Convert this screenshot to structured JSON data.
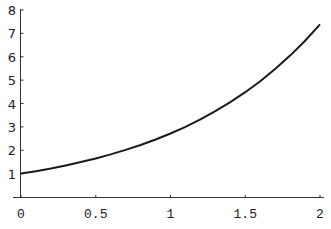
{
  "chart_data": {
    "type": "line",
    "title": "",
    "xlabel": "",
    "ylabel": "",
    "xlim": [
      0,
      2
    ],
    "ylim": [
      0,
      8
    ],
    "grid": false,
    "legend": null,
    "x_ticks": [
      0,
      0.5,
      1,
      1.5,
      2
    ],
    "x_tick_labels": [
      "0",
      "0.5",
      "1",
      "1.5",
      "2"
    ],
    "y_ticks": [
      1,
      2,
      3,
      4,
      5,
      6,
      7,
      8
    ],
    "y_tick_labels": [
      "1",
      "2",
      "3",
      "4",
      "5",
      "6",
      "7",
      "8"
    ],
    "series": [
      {
        "name": "exp(x)",
        "color": "#1a1a1a",
        "x": [
          0,
          0.1,
          0.2,
          0.3,
          0.4,
          0.5,
          0.6,
          0.7,
          0.8,
          0.9,
          1.0,
          1.1,
          1.2,
          1.3,
          1.4,
          1.5,
          1.6,
          1.7,
          1.8,
          1.9,
          2.0
        ],
        "y": [
          1.0,
          1.105,
          1.221,
          1.35,
          1.492,
          1.649,
          1.822,
          2.014,
          2.226,
          2.46,
          2.718,
          3.004,
          3.32,
          3.669,
          4.055,
          4.482,
          4.953,
          5.474,
          6.05,
          6.686,
          7.389
        ]
      }
    ]
  }
}
